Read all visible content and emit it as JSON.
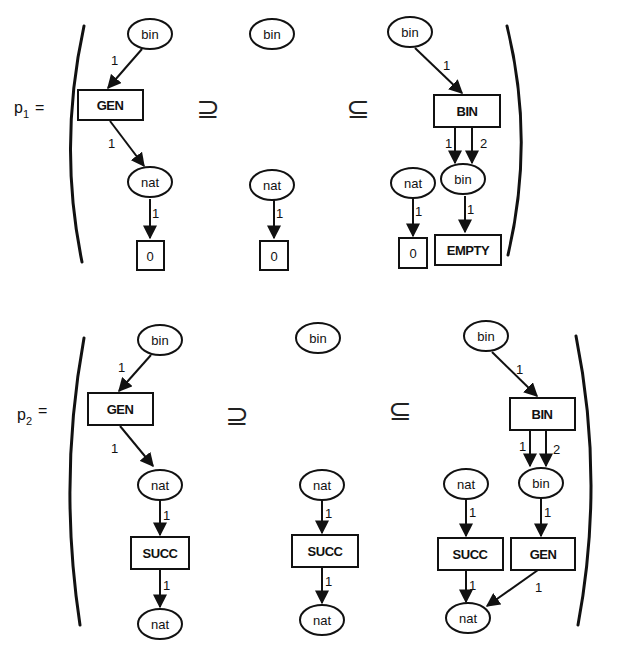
{
  "productions": [
    {
      "name": "p",
      "subscript": "1",
      "equals": "=",
      "left": {
        "places": [
          {
            "label": "bin"
          },
          {
            "label": "nat"
          }
        ],
        "transitions": [
          {
            "label": "GEN"
          },
          {
            "label": "0"
          }
        ],
        "arc_labels": [
          "1",
          "1",
          "1"
        ]
      },
      "rel_left": "⊇",
      "interface": {
        "places": [
          {
            "label": "bin"
          },
          {
            "label": "nat"
          }
        ],
        "transitions": [
          {
            "label": "0"
          }
        ],
        "arc_labels": [
          "1"
        ]
      },
      "rel_right": "⊆",
      "right": {
        "places": [
          {
            "label": "bin"
          },
          {
            "label": "nat"
          },
          {
            "label": "bin"
          }
        ],
        "transitions": [
          {
            "label": "BIN"
          },
          {
            "label": "0"
          },
          {
            "label": "EMPTY"
          }
        ],
        "arc_labels": [
          "1",
          "1",
          "2",
          "1",
          "1"
        ]
      }
    },
    {
      "name": "p",
      "subscript": "2",
      "equals": "=",
      "left": {
        "places": [
          {
            "label": "bin"
          },
          {
            "label": "nat"
          },
          {
            "label": "nat"
          }
        ],
        "transitions": [
          {
            "label": "GEN"
          },
          {
            "label": "SUCC"
          }
        ],
        "arc_labels": [
          "1",
          "1",
          "1",
          "1"
        ]
      },
      "rel_left": "⊇",
      "interface": {
        "places": [
          {
            "label": "bin"
          },
          {
            "label": "nat"
          },
          {
            "label": "nat"
          }
        ],
        "transitions": [
          {
            "label": "SUCC"
          }
        ],
        "arc_labels": [
          "1",
          "1"
        ]
      },
      "rel_right": "⊆",
      "right": {
        "places": [
          {
            "label": "bin"
          },
          {
            "label": "nat"
          },
          {
            "label": "bin"
          },
          {
            "label": "nat"
          }
        ],
        "transitions": [
          {
            "label": "BIN"
          },
          {
            "label": "SUCC"
          },
          {
            "label": "GEN"
          }
        ],
        "arc_labels": [
          "1",
          "1",
          "2",
          "1",
          "1",
          "1",
          "1"
        ]
      }
    }
  ]
}
